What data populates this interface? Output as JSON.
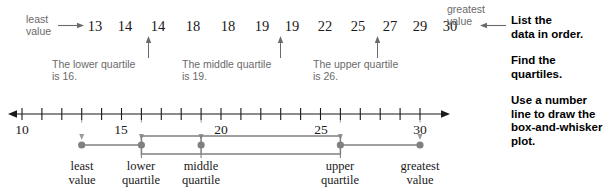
{
  "chart_data": {
    "type": "table",
    "data_ordered": [
      13,
      14,
      14,
      18,
      18,
      19,
      19,
      22,
      25,
      27,
      29,
      30
    ],
    "least_value": 13,
    "greatest_value": 30,
    "lower_quartile": 16,
    "middle_quartile": 19,
    "upper_quartile": 26,
    "axis": {
      "min": 10,
      "max": 30,
      "tick_interval": 1,
      "labeled_ticks": [
        10,
        15,
        20,
        25,
        30
      ]
    },
    "five_number_summary": [
      {
        "name": "least value",
        "value": 13
      },
      {
        "name": "lower quartile",
        "value": 16
      },
      {
        "name": "middle quartile",
        "value": 19
      },
      {
        "name": "upper quartile",
        "value": 26
      },
      {
        "name": "greatest value",
        "value": 30
      }
    ],
    "grid": false,
    "legend": "none"
  },
  "data_row": {
    "least_label_line1": "least",
    "least_label_line2": "value",
    "greatest_label_line1": "greatest",
    "greatest_label_line2": "value",
    "values": [
      "13",
      "14",
      "14",
      "18",
      "18",
      "19",
      "19",
      "22",
      "25",
      "27",
      "29",
      "30"
    ]
  },
  "quartile_captions": {
    "lower_line1": "The lower quartile",
    "lower_line2": "is 16.",
    "middle_line1": "The middle quartile",
    "middle_line2": "is 19.",
    "upper_line1": "The upper quartile",
    "upper_line2": "is 26."
  },
  "number_line": {
    "labels": [
      "10",
      "15",
      "20",
      "25",
      "30"
    ]
  },
  "plot_captions": [
    {
      "line1": "least",
      "line2": "value"
    },
    {
      "line1": "lower",
      "line2": "quartile"
    },
    {
      "line1": "middle",
      "line2": "quartile"
    },
    {
      "line1": "upper",
      "line2": "quartile"
    },
    {
      "line1": "greatest",
      "line2": "value"
    }
  ],
  "steps": [
    "List the\ndata in order.",
    "Find the\nquartiles.",
    "Use a number\nline to draw the\nbox-and-whisker\nplot."
  ],
  "colors": {
    "text": "#1a1a1a",
    "caption_gray": "#6a6a6a",
    "plot_gray": "#808080",
    "axis": "#1a1a1a"
  }
}
